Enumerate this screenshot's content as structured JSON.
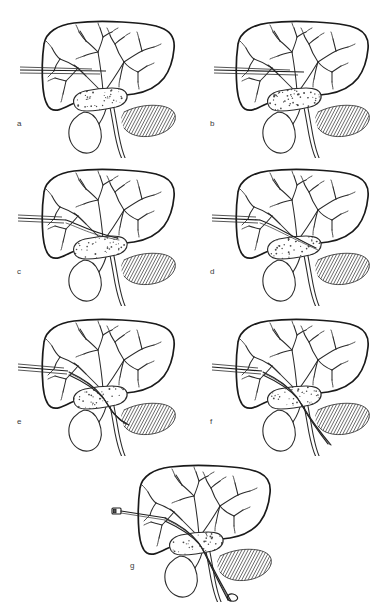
{
  "figure": {
    "background_color": "#ffffff",
    "ink_color": "#1a1a1a",
    "panel_count": 7,
    "panel_labels": [
      "a",
      "b",
      "c",
      "d",
      "e",
      "f",
      "g"
    ],
    "panels": [
      {
        "id": "a",
        "label": "a",
        "label_x": 17,
        "label_y": 120,
        "origin_x": 14,
        "origin_y": 8,
        "step_description": "Fine needle advanced into a peripheral intrahepatic bile duct",
        "instrument": "needle",
        "instrument_depth": 0.18,
        "instrument_tip_x": 92,
        "instrument_tip_y": 63
      },
      {
        "id": "b",
        "label": "b",
        "label_x": 210,
        "label_y": 120,
        "origin_x": 208,
        "origin_y": 8,
        "step_description": "Second needle pass; duct opacified with contrast",
        "instrument": "needle",
        "instrument_depth": 0.28,
        "instrument_tip_x": 96,
        "instrument_tip_y": 64
      },
      {
        "id": "c",
        "label": "c",
        "label_x": 17,
        "label_y": 268,
        "origin_x": 14,
        "origin_y": 156,
        "step_description": "Guidewire advanced toward the hilar stricture",
        "instrument": "wire",
        "instrument_depth": 0.52,
        "instrument_tip_x": 103,
        "instrument_tip_y": 82
      },
      {
        "id": "d",
        "label": "d",
        "label_x": 210,
        "label_y": 268,
        "origin_x": 208,
        "origin_y": 156,
        "step_description": "Wire traverses the tumour into the common duct",
        "instrument": "wire",
        "instrument_depth": 0.66,
        "instrument_tip_x": 108,
        "instrument_tip_y": 92
      },
      {
        "id": "e",
        "label": "e",
        "label_x": 17,
        "label_y": 418,
        "origin_x": 14,
        "origin_y": 306,
        "step_description": "Drainage catheter railroaded over the wire through the stricture",
        "instrument": "catheter",
        "instrument_depth": 0.82,
        "instrument_tip_x": 112,
        "instrument_tip_y": 118
      },
      {
        "id": "f",
        "label": "f",
        "label_x": 210,
        "label_y": 418,
        "origin_x": 208,
        "origin_y": 306,
        "step_description": "Catheter advanced down the common bile duct past the pancreas",
        "instrument": "catheter",
        "instrument_depth": 0.95,
        "instrument_tip_x": 120,
        "instrument_tip_y": 138
      },
      {
        "id": "g",
        "label": "g",
        "label_x": 130,
        "label_y": 562,
        "origin_x": 110,
        "origin_y": 452,
        "step_description": "Internal-external drain in final position with external hub",
        "instrument": "catheter-hub",
        "instrument_depth": 1.0,
        "instrument_tip_x": 118,
        "instrument_tip_y": 148
      }
    ],
    "anatomy": {
      "liver": {
        "name": "liver",
        "rendering": "outline"
      },
      "biliary_tree": {
        "name": "intrahepatic-bile-ducts",
        "rendering": "branching-line"
      },
      "tumor": {
        "name": "hilar-tumour",
        "rendering": "stippled-mass",
        "stipple_count": 64
      },
      "gallbladder": {
        "name": "gallbladder",
        "rendering": "outline"
      },
      "common_bile_duct": {
        "name": "common-bile-duct",
        "rendering": "outline"
      },
      "pancreas": {
        "name": "pancreas",
        "rendering": "hatched"
      }
    }
  }
}
